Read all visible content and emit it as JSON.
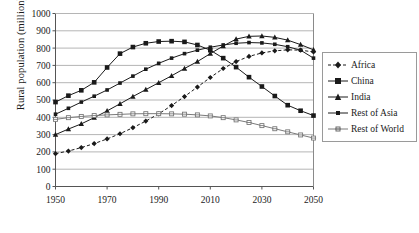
{
  "chart_data": {
    "type": "line",
    "title": "",
    "xlabel": "",
    "ylabel": "Rural population (million)",
    "xlim": [
      1950,
      2050
    ],
    "ylim": [
      0,
      1000
    ],
    "xticks": [
      1950,
      1970,
      1990,
      2010,
      2030,
      2050
    ],
    "yticks": [
      0,
      100,
      200,
      300,
      400,
      500,
      600,
      700,
      800,
      900,
      1000
    ],
    "grid": "horizontal",
    "legend_position": "right",
    "marker_interval_years": 5,
    "x": [
      1950,
      1955,
      1960,
      1965,
      1970,
      1975,
      1980,
      1985,
      1990,
      1995,
      2000,
      2005,
      2010,
      2015,
      2020,
      2025,
      2030,
      2035,
      2040,
      2045,
      2050
    ],
    "series": [
      {
        "name": "Africa",
        "marker": "diamond",
        "line_style": "dashed",
        "color": "#1a1a1a",
        "values": [
          190,
          205,
          225,
          248,
          275,
          305,
          340,
          378,
          420,
          468,
          520,
          575,
          630,
          682,
          722,
          752,
          772,
          784,
          790,
          788,
          778
        ]
      },
      {
        "name": "China",
        "marker": "square",
        "line_style": "solid",
        "color": "#1a1a1a",
        "values": [
          488,
          525,
          556,
          602,
          688,
          768,
          806,
          828,
          838,
          840,
          836,
          818,
          788,
          742,
          690,
          632,
          578,
          523,
          470,
          438,
          410
        ]
      },
      {
        "name": "India",
        "marker": "triangle",
        "line_style": "solid",
        "color": "#1a1a1a",
        "values": [
          300,
          332,
          362,
          398,
          437,
          478,
          520,
          560,
          600,
          640,
          682,
          722,
          768,
          812,
          852,
          868,
          870,
          862,
          846,
          820,
          790
        ]
      },
      {
        "name": "Rest of Asia",
        "marker": "dot",
        "line_style": "solid",
        "color": "#1a1a1a",
        "values": [
          418,
          452,
          488,
          522,
          558,
          598,
          638,
          678,
          712,
          742,
          768,
          788,
          805,
          818,
          828,
          832,
          830,
          822,
          808,
          788,
          742
        ]
      },
      {
        "name": "Rest of World",
        "marker": "cross-square",
        "line_style": "solid",
        "color": "#7a7a7a",
        "values": [
          388,
          398,
          405,
          410,
          414,
          417,
          420,
          421,
          421,
          420,
          418,
          414,
          408,
          398,
          385,
          370,
          352,
          334,
          316,
          298,
          280
        ]
      }
    ]
  },
  "axis": {
    "ylabel": "Rural population (million)"
  },
  "legend": {
    "items": [
      {
        "label": "Africa"
      },
      {
        "label": "China"
      },
      {
        "label": "India"
      },
      {
        "label": "Rest of Asia"
      },
      {
        "label": "Rest of World"
      }
    ]
  }
}
